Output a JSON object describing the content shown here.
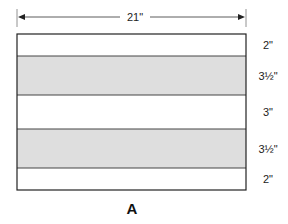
{
  "figure": {
    "label": "A",
    "width_label": "21\"",
    "strips": [
      {
        "height_label": "2\"",
        "fill": "#ffffff",
        "shaded": false
      },
      {
        "height_label": "3½\"",
        "fill": "#dedede",
        "shaded": true
      },
      {
        "height_label": "3\"",
        "fill": "#ffffff",
        "shaded": false
      },
      {
        "height_label": "3½\"",
        "fill": "#dedede",
        "shaded": true
      },
      {
        "height_label": "2\"",
        "fill": "#ffffff",
        "shaded": false
      }
    ],
    "colors": {
      "outline": "#222222",
      "divider": "#444444",
      "shade": "#dedede"
    }
  }
}
